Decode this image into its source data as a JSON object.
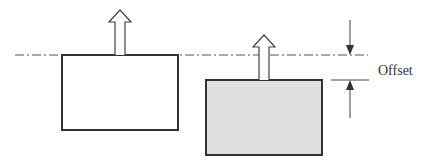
{
  "diagram": {
    "type": "offset-illustration",
    "reference_line": {
      "style": "dash-dot",
      "y": 55,
      "x_start": 15,
      "x_end": 368
    },
    "blocks": [
      {
        "name": "reference-block",
        "fill": "#ffffff",
        "x": 62,
        "y": 55,
        "width": 116,
        "height": 75,
        "arrow": {
          "direction": "up",
          "x_center": 120,
          "top": 10
        }
      },
      {
        "name": "offset-block",
        "fill": "#e0e0e0",
        "x": 206,
        "y": 80,
        "width": 116,
        "height": 75,
        "arrow": {
          "direction": "up",
          "x_center": 264,
          "top": 35
        }
      }
    ],
    "dimension": {
      "label": "Offset",
      "x": 350,
      "upper_y": 55,
      "lower_y": 80
    },
    "colors": {
      "stroke": "#333333",
      "line": "#555555",
      "grey_fill": "#e0e0e0"
    }
  }
}
